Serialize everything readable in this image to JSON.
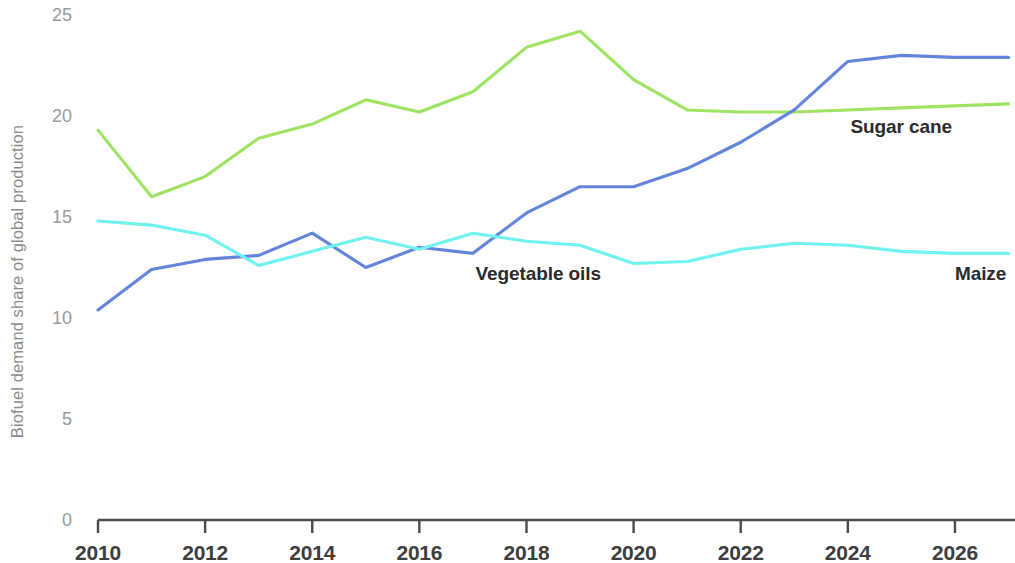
{
  "chart_data": {
    "type": "line",
    "title": "",
    "subtitle": "",
    "xlabel": "",
    "ylabel": "Biofuel demand share of global production",
    "x": [
      2010,
      2011,
      2012,
      2013,
      2014,
      2015,
      2016,
      2017,
      2018,
      2019,
      2020,
      2021,
      2022,
      2023,
      2024,
      2025,
      2026,
      2027
    ],
    "xlim": [
      2010,
      2027
    ],
    "ylim": [
      0,
      25
    ],
    "xticks": [
      2010,
      2012,
      2014,
      2016,
      2018,
      2020,
      2022,
      2024,
      2026
    ],
    "xtick_labels": [
      "2010",
      "2012",
      "2014",
      "2016",
      "2018",
      "2020",
      "2022",
      "2024",
      "2026"
    ],
    "yticks": [
      0,
      5,
      10,
      15,
      20,
      25
    ],
    "ytick_labels": [
      "0",
      "5",
      "10",
      "15",
      "20",
      "25"
    ],
    "grid": false,
    "legend_position": "inline-end-labels",
    "series": [
      {
        "name": "Sugar cane",
        "color": "#9EE362",
        "label_x": 2024.05,
        "label_y": 19.45,
        "values": [
          19.3,
          16.0,
          17.0,
          18.9,
          19.6,
          20.8,
          20.2,
          21.2,
          23.4,
          24.2,
          21.8,
          20.3,
          20.2,
          20.2,
          20.3,
          20.4,
          20.5,
          20.6
        ]
      },
      {
        "name": "Vegetable oils",
        "color": "#6384DB",
        "label_x": 2017.05,
        "label_y": 12.2,
        "values": [
          10.4,
          12.4,
          12.9,
          13.1,
          14.2,
          12.5,
          13.5,
          13.2,
          15.2,
          16.5,
          16.5,
          17.4,
          18.7,
          20.3,
          22.7,
          23.0,
          22.9,
          22.9
        ]
      },
      {
        "name": "Maize",
        "color": "#6FF2F0",
        "label_x": 2026.0,
        "label_y": 12.2,
        "values": [
          14.8,
          14.6,
          14.1,
          12.6,
          13.3,
          14.0,
          13.4,
          14.2,
          13.8,
          13.6,
          12.7,
          12.8,
          13.4,
          13.7,
          13.6,
          13.3,
          13.2,
          13.2
        ]
      }
    ]
  },
  "axis": {
    "axis_color": "#4a4a4a",
    "tick_color": "#9a9a9a"
  }
}
